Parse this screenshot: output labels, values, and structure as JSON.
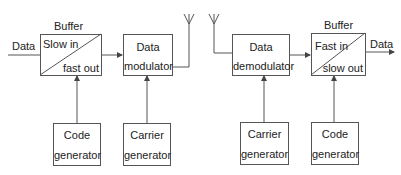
{
  "diagram": {
    "transmitter": {
      "input_label": "Data",
      "buffer": {
        "title": "Buffer",
        "top_text": "Slow in",
        "bottom_text": "fast out"
      },
      "modulator": {
        "line1": "Data",
        "line2": "modulator"
      },
      "code_generator": {
        "line1": "Code",
        "line2": "generator"
      },
      "carrier_generator": {
        "line1": "Carrier",
        "line2": "generator"
      }
    },
    "receiver": {
      "output_label": "Data",
      "demodulator": {
        "line1": "Data",
        "line2": "demodulator"
      },
      "buffer": {
        "title": "Buffer",
        "top_text": "Fast in",
        "bottom_text": "slow out"
      },
      "carrier_generator": {
        "line1": "Carrier",
        "line2": "generator"
      },
      "code_generator": {
        "line1": "Code",
        "line2": "generator"
      }
    },
    "icons": [
      "antenna-icon",
      "antenna-icon",
      "arrow-icon"
    ],
    "colors": {
      "line": "#555555",
      "text": "#222222",
      "background": "#ffffff"
    }
  }
}
